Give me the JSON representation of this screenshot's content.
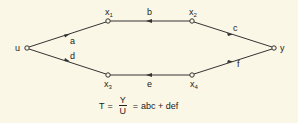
{
  "diagram": {
    "type": "signal-flow-graph",
    "nodes": [
      {
        "id": "u",
        "label": "u",
        "sub": ""
      },
      {
        "id": "x1",
        "label": "x",
        "sub": "1"
      },
      {
        "id": "x2",
        "label": "x",
        "sub": "2"
      },
      {
        "id": "y",
        "label": "y",
        "sub": ""
      },
      {
        "id": "x3",
        "label": "x",
        "sub": "3"
      },
      {
        "id": "x4",
        "label": "x",
        "sub": "4"
      }
    ],
    "edges": [
      {
        "from": "u",
        "to": "x1",
        "gain": "a"
      },
      {
        "from": "x1",
        "to": "x2",
        "gain": "b"
      },
      {
        "from": "x2",
        "to": "y",
        "gain": "c"
      },
      {
        "from": "u",
        "to": "x3",
        "gain": "d"
      },
      {
        "from": "x3",
        "to": "x4",
        "gain": "e"
      },
      {
        "from": "x4",
        "to": "y",
        "gain": "f"
      }
    ],
    "equation": {
      "lhs": "T",
      "eq1": "=",
      "numerator": "Y",
      "denominator": "U",
      "eq2": "=",
      "rhs": "abc + def"
    },
    "colors": {
      "line": "#333333",
      "background": "#fbf7e6"
    }
  }
}
